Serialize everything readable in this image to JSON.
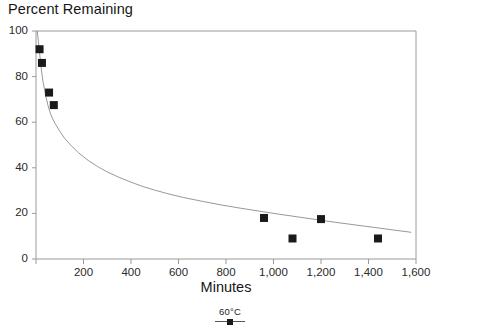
{
  "chart_data": {
    "type": "scatter",
    "title": "",
    "ylabel": "Percent Remaining",
    "xlabel": "Minutes",
    "xlim": [
      0,
      1600
    ],
    "ylim": [
      0,
      100
    ],
    "grid": false,
    "legend_position": "bottom",
    "x_ticks": [
      0,
      200,
      400,
      600,
      800,
      1000,
      1200,
      1400,
      1600
    ],
    "x_tick_labels": [
      "",
      "200",
      "400",
      "600",
      "800",
      "1,000",
      "1,200",
      "1,400",
      "1,600"
    ],
    "y_ticks": [
      0,
      20,
      40,
      60,
      80,
      100
    ],
    "y_tick_labels": [
      "0",
      "20",
      "40",
      "60",
      "80",
      "100"
    ],
    "series": [
      {
        "name": "60°C",
        "marker": "filled-square",
        "color": "#1a1a1a",
        "x": [
          15,
          25,
          55,
          75,
          960,
          1080,
          1200,
          1440
        ],
        "values": [
          92,
          86,
          73,
          67.5,
          18,
          9,
          17.5,
          9
        ]
      },
      {
        "name": "fit-curve",
        "type": "line",
        "color": "#8c8c8c",
        "x": [
          5,
          10,
          15,
          20,
          25,
          30,
          40,
          50,
          60,
          70,
          80,
          100,
          120,
          150,
          180,
          220,
          260,
          300,
          350,
          400,
          450,
          500,
          560,
          620,
          700,
          780,
          860,
          940,
          1020,
          1100,
          1180,
          1260,
          1340,
          1420,
          1500,
          1580
        ],
        "values": [
          100,
          95.5,
          90.5,
          85.5,
          81,
          77.5,
          72,
          67.5,
          64,
          61.5,
          59.5,
          56,
          53,
          49.5,
          46.5,
          43.2,
          40.5,
          38.2,
          35.8,
          33.7,
          31.8,
          30.2,
          28.5,
          27,
          25.3,
          23.7,
          22.3,
          21,
          19.7,
          18.5,
          17.3,
          16.1,
          15,
          13.9,
          12.8,
          11.7
        ]
      }
    ]
  },
  "axis": {
    "y_title": "Percent Remaining",
    "x_title": "Minutes"
  },
  "legend": {
    "entries": [
      {
        "label": "60°C",
        "marker": "filled-square",
        "color": "#1a1a1a"
      }
    ]
  },
  "colors": {
    "axis": "#9a9a9a",
    "curve": "#8c8c8c",
    "marker": "#1a1a1a",
    "text": "#1a1a1a",
    "background": "#ffffff"
  }
}
